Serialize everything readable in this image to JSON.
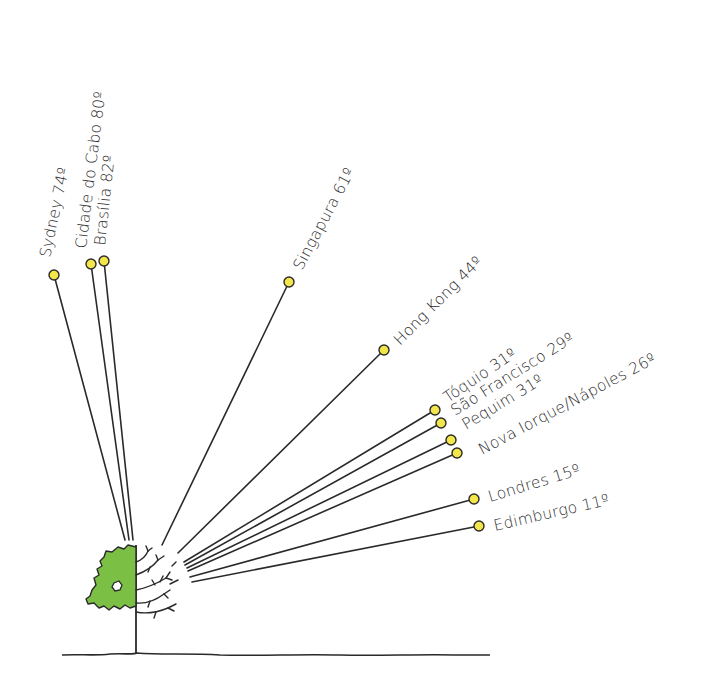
{
  "colors": {
    "pin_fill": "#f2e64a",
    "foliage_fill": "#7cbf45",
    "ink": "#2a2a2a",
    "background": "#ffffff"
  },
  "cities": [
    {
      "id": "sydney",
      "name": "Sydney",
      "value": "74º",
      "label": "Sydney 74º",
      "pin": [
        54,
        275
      ],
      "origin": [
        125,
        540
      ],
      "angle": -90
    },
    {
      "id": "cidade-do-cabo",
      "name": "Cidade do Cabo",
      "value": "80º",
      "label": "Cidade do Cabo 80º",
      "pin": [
        91,
        264
      ],
      "origin": [
        129,
        540
      ],
      "angle": -90
    },
    {
      "id": "brasilia",
      "name": "Brasília",
      "value": "82º",
      "label": "Brasília 82º",
      "pin": [
        104,
        261
      ],
      "origin": [
        133,
        540
      ],
      "angle": -90
    },
    {
      "id": "singapura",
      "name": "Singapura",
      "value": "61º",
      "label": "Singapura 61º",
      "pin": [
        289,
        282
      ],
      "origin": [
        162,
        545
      ],
      "angle": -61
    },
    {
      "id": "hong-kong",
      "name": "Hong Kong",
      "value": "44º",
      "label": "Hong Kong 44º",
      "pin": [
        384,
        350
      ],
      "origin": [
        178,
        553
      ],
      "angle": -44
    },
    {
      "id": "toquio",
      "name": "Tóquio",
      "value": "31º",
      "label": "Tóquio 31º",
      "pin": [
        435,
        410
      ],
      "origin": [
        184,
        562
      ],
      "angle": -31
    },
    {
      "id": "sao-francisco",
      "name": "São Francisco",
      "value": "29º",
      "label": "São Francisco 29º",
      "pin": [
        441,
        423
      ],
      "origin": [
        185,
        565
      ],
      "angle": -31
    },
    {
      "id": "pequim",
      "name": "Pequim",
      "value": "31º",
      "label": "Pequim 31º",
      "pin": [
        451,
        440
      ],
      "origin": [
        187,
        568
      ],
      "angle": -31
    },
    {
      "id": "nova-iorque-napoles",
      "name": "Nova Iorque/Nápoles",
      "value": "26º",
      "label": "Nova Iorque/Nápoles 26º",
      "pin": [
        457,
        453
      ],
      "origin": [
        188,
        571
      ],
      "angle": -31
    },
    {
      "id": "londres",
      "name": "Londres",
      "value": "15º",
      "label": "Londres 15º",
      "pin": [
        474,
        499
      ],
      "origin": [
        190,
        577
      ],
      "angle": -15
    },
    {
      "id": "edimburgo",
      "name": "Edimburgo",
      "value": "11º",
      "label": "Edimburgo 11º",
      "pin": [
        479,
        526
      ],
      "origin": [
        192,
        582
      ],
      "angle": -11
    }
  ],
  "labels": {
    "sydney": "Sydney 74º",
    "cidade_do_cabo": "Cidade do Cabo 80º",
    "brasilia": "Brasília 82º",
    "singapura": "Singapura 61º",
    "hong_kong": "Hong Kong 44º",
    "toquio": "Tóquio 31º",
    "sao_francisco": "São Francisco 29º",
    "pequim": "Pequim 31º",
    "nova_iorque": "Nova Iorque/Nápoles 26º",
    "londres": "Londres 15º",
    "edimburgo": "Edimburgo 11º"
  }
}
